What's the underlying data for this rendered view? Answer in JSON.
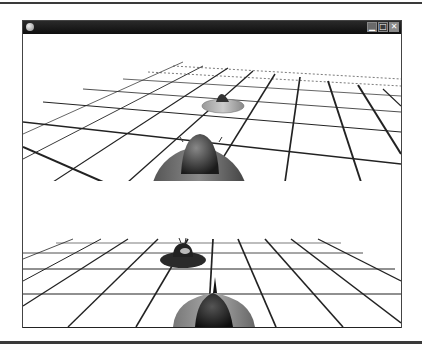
{
  "window": {
    "title": "",
    "controls": [
      {
        "name": "minimize",
        "glyph": "▁"
      },
      {
        "name": "maximize",
        "glyph": "□"
      },
      {
        "name": "close",
        "glyph": "✕"
      }
    ]
  },
  "viewports": [
    {
      "name": "player-1-view",
      "objects": [
        "grid-floor",
        "distant-saucer-ship",
        "player-saucer-ship"
      ]
    },
    {
      "name": "player-2-view",
      "objects": [
        "grid-floor",
        "distant-saucer-ship",
        "player-ship"
      ]
    }
  ],
  "colors": {
    "titlebar": "#1a1a1a",
    "grid_line": "#222222",
    "background": "#ffffff"
  }
}
